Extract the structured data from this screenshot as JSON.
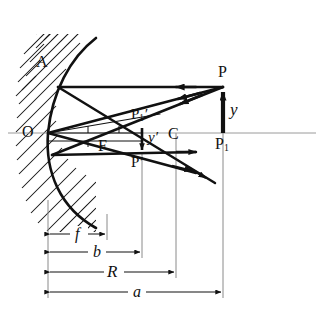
{
  "figure": {
    "type": "optics-ray-diagram",
    "background_color": "#ffffff",
    "ink_color": "#111111",
    "thin_line_color": "#8a8a8a"
  },
  "labels": {
    "mirror_edge": "A",
    "vertex": "O",
    "focus": "F",
    "center_of_curvature": "C",
    "object_top": "P",
    "object_base": "P",
    "object_base_sub": "1",
    "image_top_axis": "P",
    "image_top_axis_sub": "1",
    "image_top_axis_prime": "′",
    "image_point": "P",
    "image_point_prime": "′",
    "object_height": "y",
    "image_height": "y",
    "image_height_prime": "′"
  },
  "dimensions": [
    {
      "name": "focal-length",
      "symbol": "f",
      "from_x": 48,
      "to_x": 107,
      "y": 234
    },
    {
      "name": "image-distance",
      "symbol": "b",
      "from_x": 48,
      "to_x": 142,
      "y": 252
    },
    {
      "name": "radius-of-curvature",
      "symbol": "R",
      "from_x": 48,
      "to_x": 176,
      "y": 272
    },
    {
      "name": "object-distance",
      "symbol": "a",
      "from_x": 48,
      "to_x": 223,
      "y": 292
    }
  ],
  "points": {
    "O": {
      "x": 48,
      "y": 133
    },
    "F": {
      "x": 107,
      "y": 133
    },
    "C": {
      "x": 176,
      "y": 133
    },
    "P": {
      "x": 223,
      "y": 87
    },
    "P1": {
      "x": 223,
      "y": 133
    },
    "P_image": {
      "x": 142,
      "y": 152
    },
    "P1_image": {
      "x": 142,
      "y": 133
    },
    "mirror_hit_top": {
      "x": 58,
      "y": 92
    },
    "mirror_hit_mid": {
      "x": 48,
      "y": 133
    },
    "mirror_hit_low": {
      "x": 52,
      "y": 155
    }
  },
  "geometry": {
    "axis_y": 133,
    "axis_x_start": 8,
    "axis_x_end": 316,
    "mirror_top": {
      "x": 96,
      "y": 38
    },
    "mirror_bottom": {
      "x": 96,
      "y": 228
    },
    "hatch_count": 26
  },
  "ray_arrow_labels": {
    "incoming_parallel": "parallel ray toward mirror",
    "incoming_through_center": "ray through center of curvature",
    "incoming_through_focus": "ray through focus",
    "outgoing": "reflected diverging rays"
  }
}
